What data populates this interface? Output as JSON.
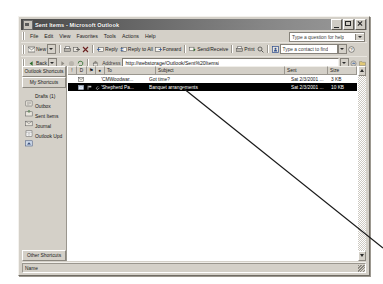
{
  "window": {
    "title": "Sent Items - Microsoft Outlook",
    "app_icon": "outlook-icon",
    "buttons": {
      "minimize": "minimize-icon",
      "maximize": "maximize-icon",
      "close": "close-icon"
    }
  },
  "menu": {
    "items": [
      "File",
      "Edit",
      "View",
      "Favorites",
      "Tools",
      "Actions",
      "Help"
    ],
    "ask_box": {
      "value": "Type a question for help"
    }
  },
  "toolbar": {
    "new_label": "New",
    "print_label": "Print",
    "reply_label": "Reply",
    "reply_all_label": "Reply to All",
    "forward_label": "Forward",
    "send_receive_label": "Send/Receive",
    "find_contact": {
      "value": "Type a contact to find"
    },
    "icons": [
      "new-mail-icon",
      "print-icon",
      "move-icon",
      "delete-icon",
      "reply-icon",
      "reply-all-icon",
      "forward-icon",
      "send-receive-icon",
      "print-icon",
      "find-icon",
      "address-book-icon",
      "help-icon"
    ]
  },
  "address_bar": {
    "back_label": "Back",
    "address_label": "Address",
    "url": "http://webstorage/Outlook/Sent%20Items/",
    "go_label": "Go"
  },
  "sidebar": {
    "group_outlook": "Outlook Shortcuts",
    "group_my": "My Shortcuts",
    "group_other": "Other Shortcuts",
    "items": [
      {
        "label": "Drafts (1)",
        "icon": "drafts-folder-icon"
      },
      {
        "label": "Outbox",
        "icon": "outbox-folder-icon"
      },
      {
        "label": "Sent Items",
        "icon": "sent-items-folder-icon"
      },
      {
        "label": "Journal",
        "icon": "journal-folder-icon"
      },
      {
        "label": "Outlook Upd",
        "icon": "outlook-update-icon"
      }
    ]
  },
  "message_list": {
    "columns": [
      {
        "label": "!",
        "name": "importance"
      },
      {
        "label": "D",
        "name": "icon"
      },
      {
        "label": "⚑",
        "name": "flag"
      },
      {
        "label": "●",
        "name": "attachment"
      },
      {
        "label": "To",
        "name": "to"
      },
      {
        "label": "Subject",
        "name": "subject"
      },
      {
        "label": "Sent",
        "name": "sent"
      },
      {
        "label": "Size",
        "name": "size"
      }
    ],
    "sort_indicator": "▼",
    "rows": [
      {
        "icon": "sent-mail-icon",
        "to": "'CMWoodwar...",
        "subject": "Got time?",
        "sent": "Sat 2/3/2001 ...",
        "size": "3 KB",
        "selected": false
      },
      {
        "icon": "sent-mail-icon",
        "to": "'Shepherd Pa...",
        "subject": "Banquet arrangements",
        "sent": "Sat 2/3/2001 ...",
        "size": "10 KB",
        "selected": true
      }
    ]
  },
  "status_bar": {
    "text": "Name"
  },
  "colors": {
    "window_face": "#d4d0c8",
    "title_dark": "#4a4a4a",
    "selection": "#000000",
    "list_bg": "#ffffff",
    "annotation_line": "#1a1a1a"
  }
}
